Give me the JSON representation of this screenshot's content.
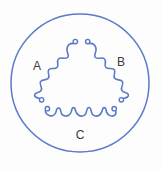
{
  "diagram": {
    "background_color": "#fdfdfd",
    "line_color": "#5a79c8",
    "label_color": "#3b3b3b",
    "stator": {
      "shape": "circle",
      "center_x": 80,
      "center_y": 83,
      "radius": 69
    },
    "phases": [
      {
        "id": "A",
        "label": "A",
        "label_x": 37,
        "label_y": 67,
        "position": "left",
        "coil_turns": 5,
        "terminals": 2
      },
      {
        "id": "B",
        "label": "B",
        "label_x": 121,
        "label_y": 63,
        "position": "right",
        "coil_turns": 5,
        "terminals": 2
      },
      {
        "id": "C",
        "label": "C",
        "label_x": 80,
        "label_y": 136,
        "position": "bottom",
        "coil_turns": 5,
        "terminals": 2
      }
    ],
    "terminal_points": [
      {
        "name": "phase-a-top-terminal",
        "x": 74,
        "y": 41
      },
      {
        "name": "phase-b-top-terminal",
        "x": 90,
        "y": 41
      },
      {
        "name": "phase-a-bottom-terminal",
        "x": 42,
        "y": 100
      },
      {
        "name": "phase-b-bottom-terminal",
        "x": 121,
        "y": 100
      },
      {
        "name": "phase-c-left-terminal",
        "x": 47,
        "y": 110
      },
      {
        "name": "phase-c-right-terminal",
        "x": 114,
        "y": 110
      }
    ]
  }
}
